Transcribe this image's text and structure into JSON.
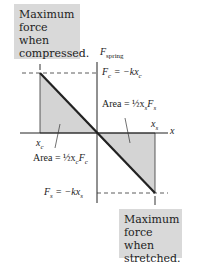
{
  "callouts": {
    "top": {
      "lines": [
        "Maximum",
        "force when",
        "compressed."
      ]
    },
    "bottom": {
      "lines": [
        "Maximum",
        "force when",
        "stretched."
      ]
    }
  },
  "labels": {
    "y_axis": "F",
    "y_axis_sub": "spring",
    "x_axis": "x",
    "fc_eq": "F",
    "fc_sub": "c",
    "fc_rhs": " = −kx",
    "fc_rhs_sub": "c",
    "fs_eq": "F",
    "fs_sub": "s",
    "fs_rhs": " = −kx",
    "fs_rhs_sub": "s",
    "xs": "x",
    "xs_sub": "s",
    "xc": "x",
    "xc_sub": "c",
    "area_s": "Area = ½x",
    "area_s_tail": "F",
    "area_c": "Area = ½x",
    "area_c_tail": "F"
  },
  "colors": {
    "shade": "#d4d4d4",
    "line": "#222222",
    "callout": "#d9d9d9"
  }
}
